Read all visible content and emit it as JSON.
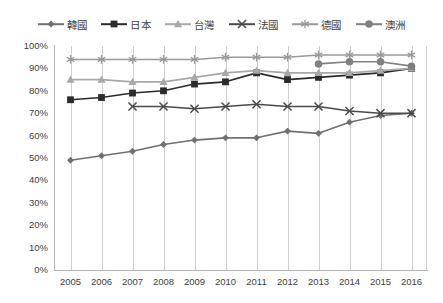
{
  "chart_data": {
    "type": "line",
    "title": "",
    "subtitle": "",
    "xlabel": "",
    "ylabel": "",
    "ylim": [
      0,
      100
    ],
    "ytick_labels": [
      "100%",
      "90%",
      "80%",
      "70%",
      "60%",
      "50%",
      "40%",
      "30%",
      "20%",
      "10%",
      "0%"
    ],
    "ytick_values": [
      100,
      90,
      80,
      70,
      60,
      50,
      40,
      30,
      20,
      10,
      0
    ],
    "categories": [
      "2005",
      "2006",
      "2007",
      "2008",
      "2009",
      "2010",
      "2011",
      "2012",
      "2013",
      "2014",
      "2015",
      "2016"
    ],
    "x": [
      2005,
      2006,
      2007,
      2008,
      2009,
      2010,
      2011,
      2012,
      2013,
      2014,
      2015,
      2016
    ],
    "grid": "vertical",
    "legend_position": "top",
    "value_unit": "%",
    "series": [
      {
        "name": "韓國",
        "marker": "diamond",
        "color": "#707070",
        "values": [
          49,
          51,
          53,
          56,
          58,
          59,
          59,
          62,
          61,
          66,
          69,
          70
        ]
      },
      {
        "name": "日本",
        "marker": "square",
        "color": "#2b2b2b",
        "values": [
          76,
          77,
          79,
          80,
          83,
          84,
          88,
          85,
          86,
          87,
          88,
          90
        ]
      },
      {
        "name": "台灣",
        "marker": "triangle",
        "color": "#a8a8a8",
        "values": [
          85,
          85,
          84,
          84,
          86,
          88,
          89,
          88,
          88,
          88,
          89,
          90
        ]
      },
      {
        "name": "法國",
        "marker": "x",
        "color": "#4a4a4a",
        "values": [
          null,
          null,
          73,
          73,
          72,
          73,
          74,
          73,
          73,
          71,
          70,
          70
        ]
      },
      {
        "name": "德國",
        "marker": "asterisk",
        "color": "#999999",
        "values": [
          94,
          94,
          94,
          94,
          94,
          95,
          95,
          95,
          96,
          96,
          96,
          96
        ]
      },
      {
        "name": "澳洲",
        "marker": "circle",
        "color": "#808080",
        "values": [
          null,
          null,
          null,
          null,
          null,
          null,
          null,
          null,
          92,
          93,
          93,
          91
        ]
      }
    ]
  },
  "legend": {
    "items": [
      {
        "label": "韓國",
        "marker": "diamond",
        "color": "#707070"
      },
      {
        "label": "日本",
        "marker": "square",
        "color": "#2b2b2b"
      },
      {
        "label": "台灣",
        "marker": "triangle",
        "color": "#a8a8a8"
      },
      {
        "label": "法國",
        "marker": "x",
        "color": "#4a4a4a"
      },
      {
        "label": "德國",
        "marker": "asterisk",
        "color": "#999999"
      },
      {
        "label": "澳洲",
        "marker": "circle",
        "color": "#808080"
      }
    ]
  }
}
